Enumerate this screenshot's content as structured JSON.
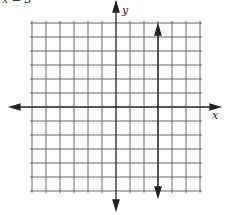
{
  "header": {
    "title_fragment": "x = 3"
  },
  "chart_data": {
    "type": "line",
    "title": "x = 3",
    "xlabel": "x",
    "ylabel": "y",
    "xlim": [
      -6,
      6
    ],
    "ylim": [
      -6,
      6
    ],
    "grid": true,
    "grid_step": 1,
    "series": [
      {
        "name": "x = 3",
        "equation": "x = 3",
        "x": [
          3,
          3
        ],
        "y": [
          6,
          -6
        ],
        "arrows": "both"
      }
    ]
  },
  "colors": {
    "grid": "#555555",
    "axis": "#222222",
    "line": "#222222",
    "background": "#ffffff"
  }
}
